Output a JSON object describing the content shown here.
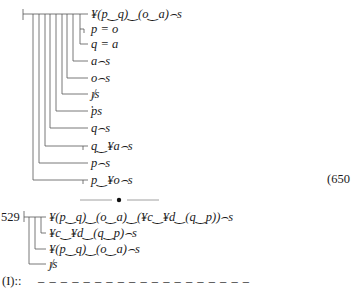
{
  "proof_top": {
    "equation_number": "(650",
    "rows": [
      {
        "text": "¥(p‿q)‿(o‿a)⌢s",
        "x": 91,
        "y": 7
      },
      {
        "text": "p = o",
        "x": 91,
        "y": 22
      },
      {
        "text": "q = a",
        "x": 91,
        "y": 37
      },
      {
        "text": "a⌢s",
        "x": 91,
        "y": 54
      },
      {
        "text": "o⌢s",
        "x": 91,
        "y": 71
      },
      {
        "text": "ȷ̸s",
        "x": 91,
        "y": 87
      },
      {
        "text": "̔ps",
        "x": 91,
        "y": 104
      },
      {
        "text": "q⌢s",
        "x": 91,
        "y": 121
      },
      {
        "text": "q‿¥a⌢s",
        "x": 91,
        "y": 139
      },
      {
        "text": "p⌢s",
        "x": 91,
        "y": 156
      },
      {
        "text": "p‿¥o⌢s",
        "x": 91,
        "y": 173
      }
    ]
  },
  "separator": {
    "symbol": "•"
  },
  "proof_bottom": {
    "label": "529",
    "rows": [
      {
        "text": "¥(p‿q)‿(o‿a)‿(¥c‿¥d‿(q‿p))⌢s",
        "x": 49,
        "y": 210
      },
      {
        "text": "¥c‿¥d‿(q‿p)⌢s",
        "x": 49,
        "y": 226
      },
      {
        "text": "¥(p‿q)‿(o‿a)⌢s",
        "x": 49,
        "y": 242
      },
      {
        "text": "ȷ̸s",
        "x": 49,
        "y": 257
      }
    ]
  },
  "footer": {
    "label": "(I)::",
    "dashes": "– – – – – – – – – – – – – – – – – – –"
  }
}
